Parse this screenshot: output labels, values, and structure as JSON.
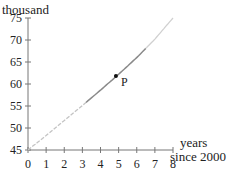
{
  "chart_data": {
    "type": "line",
    "title": "",
    "ylabel": "thousand",
    "xlabel_line1": "years",
    "xlabel_line2": "since 2000",
    "xlim": [
      0,
      8
    ],
    "ylim": [
      45,
      75
    ],
    "x_ticks": [
      "0",
      "1",
      "2",
      "3",
      "4",
      "5",
      "6",
      "7",
      "8"
    ],
    "y_ticks": [
      "45",
      "50",
      "55",
      "60",
      "65",
      "70",
      "75"
    ],
    "grid": false,
    "series": [
      {
        "name": "curve",
        "x": [
          0,
          1,
          2,
          3,
          4,
          5,
          6,
          7,
          8
        ],
        "values": [
          45,
          48.3,
          51.7,
          55.1,
          58.6,
          62.2,
          66,
          70.2,
          75
        ]
      }
    ],
    "annotations": [
      {
        "label": "P",
        "x": 4.85,
        "y": 61.8
      }
    ],
    "segments": {
      "faded_start": [
        0,
        3.2
      ],
      "solid": [
        3.2,
        6.5
      ],
      "faded_end": [
        6.5,
        8
      ]
    }
  }
}
